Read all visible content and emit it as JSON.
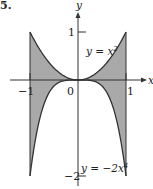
{
  "figure": {
    "label": "5.",
    "shade_color": "#a9a9a9",
    "curve_color": "#333333",
    "axis_color": "#333333"
  },
  "chart_data": {
    "type": "area",
    "title": "",
    "xlabel": "x",
    "ylabel": "y",
    "xlim": [
      -1.1,
      1.35
    ],
    "ylim": [
      -2.1,
      1.4
    ],
    "grid": false,
    "x_ticks": [
      {
        "value": -1,
        "label": "-1"
      },
      {
        "value": 0,
        "label": "0"
      },
      {
        "value": 1,
        "label": "1"
      }
    ],
    "y_ticks": [
      {
        "value": 1,
        "label": "1"
      },
      {
        "value": -2,
        "label": "-2"
      }
    ],
    "series": [
      {
        "name": "y = x²",
        "expression": "x^2",
        "x": [
          -1,
          -0.75,
          -0.5,
          -0.25,
          0,
          0.25,
          0.5,
          0.75,
          1
        ],
        "values": [
          1,
          0.5625,
          0.25,
          0.0625,
          0,
          0.0625,
          0.25,
          0.5625,
          1
        ]
      },
      {
        "name": "y = -2x⁴",
        "expression": "-2x^4",
        "x": [
          -1,
          -0.75,
          -0.5,
          -0.25,
          0,
          0.25,
          0.5,
          0.75,
          1
        ],
        "values": [
          -2,
          -0.6328,
          -0.125,
          -0.0078,
          0,
          -0.0078,
          -0.125,
          -0.6328,
          -2
        ]
      }
    ],
    "shaded_region": {
      "between": [
        "x^2",
        "-2x^4"
      ],
      "x_from": -1,
      "x_to": 1
    },
    "annotations": [
      {
        "text": "y = x²",
        "position": "upper right, near (0.5, 0.65)"
      },
      {
        "text": "y = −2x⁴",
        "position": "lower right, near (0.1, -1.9)"
      }
    ]
  },
  "labels": {
    "x_axis": "x",
    "y_axis": "y",
    "tick_x_neg1": "−1",
    "tick_x_0": "0",
    "tick_x_1": "1",
    "tick_y_1": "1",
    "tick_y_neg2": "−2",
    "curve_upper_prefix": "y = x",
    "curve_upper_exp": "2",
    "curve_lower_prefix": "y = −2x",
    "curve_lower_exp": "4"
  }
}
